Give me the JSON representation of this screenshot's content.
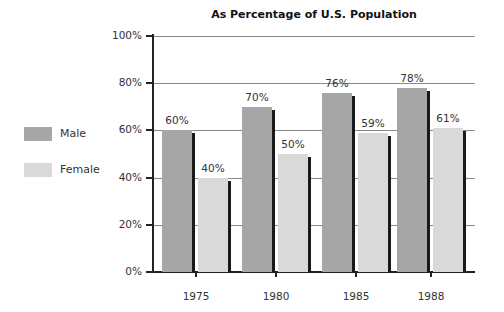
{
  "chart_data": {
    "type": "bar",
    "title": "As Percentage of U.S. Population",
    "xlabel": "",
    "ylabel": "",
    "categories": [
      "1975",
      "1980",
      "1985",
      "1988"
    ],
    "series": [
      {
        "name": "Male",
        "values": [
          60,
          70,
          76,
          78
        ],
        "color": "#a6a6a6"
      },
      {
        "name": "Female",
        "values": [
          40,
          50,
          59,
          61
        ],
        "color": "#d9d9d9"
      }
    ],
    "data_labels": {
      "Male": [
        "60%",
        "70%",
        "76%",
        "78%"
      ],
      "Female": [
        "40%",
        "50%",
        "59%",
        "61%"
      ]
    },
    "ylim": [
      0,
      100
    ],
    "yticks": [
      0,
      20,
      40,
      60,
      80,
      100
    ],
    "ytick_labels": [
      "0%",
      "20%",
      "40%",
      "60%",
      "80%",
      "100%"
    ],
    "grid": true,
    "legend_position": "left"
  },
  "legend": {
    "items": [
      {
        "label": "Male",
        "color": "#a6a6a6"
      },
      {
        "label": "Female",
        "color": "#d9d9d9"
      }
    ]
  }
}
